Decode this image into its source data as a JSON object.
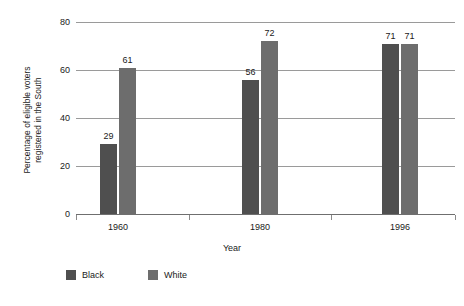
{
  "chart_data": {
    "type": "bar",
    "title": "",
    "subtitle": "",
    "xlabel": "Year",
    "ylabel": "Percentage of eligible voters registered in the South",
    "ylabel_line1": "Percentage of eligible voters",
    "ylabel_line2": "registered in the South",
    "categories": [
      "1960",
      "1980",
      "1996"
    ],
    "series": [
      {
        "name": "Black",
        "color": "#4f4f4f",
        "values": [
          29,
          56,
          71
        ]
      },
      {
        "name": "White",
        "color": "#6d6d6d",
        "values": [
          61,
          72,
          71
        ]
      }
    ],
    "ylim": [
      0,
      80
    ],
    "yticks": [
      0,
      20,
      40,
      60,
      80
    ],
    "ytick_labels": [
      "0",
      "20",
      "40",
      "60",
      "80"
    ],
    "grid": "horizontal",
    "legend_position": "bottom-left",
    "data_labels": true,
    "background_color": "#ffffff",
    "gridline_color": "#9a9a9a",
    "axis_color": "#6f6f6f"
  }
}
